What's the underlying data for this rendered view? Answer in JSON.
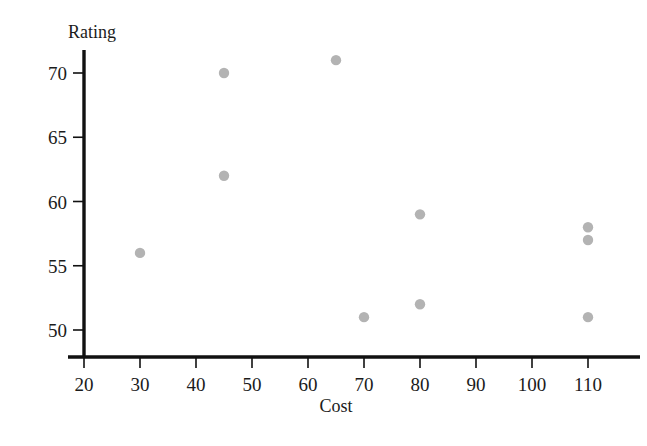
{
  "chart_data": {
    "type": "scatter",
    "title": "",
    "subtitle": "",
    "xlabel": "Cost",
    "ylabel": "Rating",
    "xlim": [
      20,
      116
    ],
    "ylim": [
      50,
      72
    ],
    "xticks": [
      20,
      30,
      40,
      50,
      60,
      70,
      80,
      90,
      100,
      110
    ],
    "yticks": [
      50,
      55,
      60,
      65,
      70
    ],
    "grid": false,
    "legend": null,
    "marker_color": "#b3b3b3",
    "axis_color": "#111111",
    "series": [
      {
        "name": "observations",
        "points": [
          {
            "x": 30,
            "y": 56
          },
          {
            "x": 45,
            "y": 70
          },
          {
            "x": 45,
            "y": 62
          },
          {
            "x": 65,
            "y": 71
          },
          {
            "x": 70,
            "y": 51
          },
          {
            "x": 80,
            "y": 59
          },
          {
            "x": 80,
            "y": 52
          },
          {
            "x": 110,
            "y": 58
          },
          {
            "x": 110,
            "y": 57
          },
          {
            "x": 110,
            "y": 51
          }
        ]
      }
    ]
  },
  "labels": {
    "y_axis_title": "Rating",
    "x_axis_title": "Cost",
    "x_tick_texts": [
      "20",
      "30",
      "40",
      "50",
      "60",
      "70",
      "80",
      "90",
      "100",
      "110"
    ],
    "y_tick_texts": [
      "50",
      "55",
      "60",
      "65",
      "70"
    ]
  }
}
